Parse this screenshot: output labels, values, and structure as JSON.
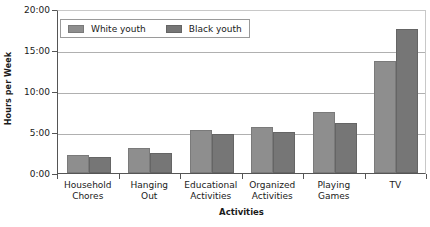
{
  "chart_data": {
    "type": "bar",
    "title": "",
    "xlabel": "Activities",
    "ylabel": "Hours per Week",
    "categories": [
      "Household\nChores",
      "Hanging\nOut",
      "Educational\nActivities",
      "Organized\nActivities",
      "Playing\nGames",
      "TV"
    ],
    "series": [
      {
        "name": "White youth",
        "color": "#8e8e8e",
        "values": [
          2.2,
          3.0,
          5.2,
          5.6,
          7.5,
          13.6
        ]
      },
      {
        "name": "Black youth",
        "color": "#767676",
        "values": [
          2.0,
          2.4,
          4.8,
          5.0,
          6.1,
          17.6
        ]
      }
    ],
    "ylim": [
      0,
      20
    ],
    "ytick_values": [
      0,
      5,
      10,
      15,
      20
    ],
    "ytick_labels": [
      "0:00",
      "5:00",
      "10:00",
      "15:00",
      "20:00"
    ],
    "grid": true,
    "legend_position": "top-left"
  },
  "legend": {
    "entries": [
      {
        "label": "White youth"
      },
      {
        "label": "Black youth"
      }
    ]
  },
  "axes": {
    "y_title": "Hours per Week",
    "x_title": "Activities"
  }
}
